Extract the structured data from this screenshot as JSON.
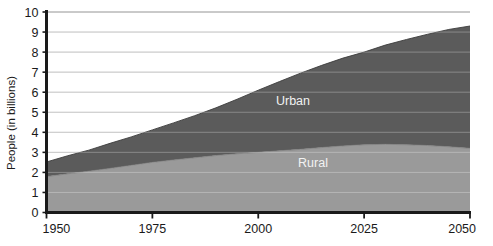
{
  "chart_data": {
    "type": "area",
    "title": "",
    "subtitle": "",
    "xlabel": "",
    "ylabel": "People (in billions)",
    "x": [
      1950,
      1955,
      1960,
      1965,
      1970,
      1975,
      1980,
      1985,
      1990,
      1995,
      2000,
      2005,
      2010,
      2015,
      2020,
      2025,
      2030,
      2035,
      2040,
      2045,
      2050
    ],
    "xlim": [
      1950,
      2050
    ],
    "ylim": [
      0,
      10
    ],
    "xticks": [
      1950,
      1975,
      2000,
      2025,
      2050
    ],
    "xtick_labels": [
      "1950",
      "1975",
      "2000",
      "2025",
      "2050"
    ],
    "yticks": [
      0,
      1,
      2,
      3,
      4,
      5,
      6,
      7,
      8,
      9,
      10
    ],
    "ytick_labels": [
      "0",
      "1",
      "2",
      "3",
      "4",
      "5",
      "6",
      "7",
      "8",
      "9",
      "10"
    ],
    "grid": "horizontal",
    "legend": "inline-labels",
    "stacked": true,
    "series": [
      {
        "name": "Rural",
        "label": "Rural",
        "color": "#9a9a9a",
        "values": [
          1.79,
          1.93,
          2.06,
          2.2,
          2.35,
          2.5,
          2.62,
          2.73,
          2.84,
          2.93,
          3.0,
          3.08,
          3.15,
          3.24,
          3.32,
          3.38,
          3.4,
          3.38,
          3.34,
          3.28,
          3.2
        ]
      },
      {
        "name": "Urban",
        "label": "Urban",
        "color": "#5b5b5b",
        "values": [
          0.73,
          0.9,
          1.05,
          1.25,
          1.42,
          1.62,
          1.85,
          2.1,
          2.38,
          2.72,
          3.1,
          3.45,
          3.8,
          4.1,
          4.38,
          4.62,
          4.95,
          5.25,
          5.55,
          5.85,
          6.1
        ]
      }
    ],
    "totals": [
      2.52,
      2.83,
      3.11,
      3.45,
      3.77,
      4.12,
      4.47,
      4.83,
      5.22,
      5.65,
      6.1,
      6.53,
      6.95,
      7.34,
      7.7,
      8.0,
      8.35,
      8.63,
      8.89,
      9.13,
      9.3
    ]
  },
  "axis": {
    "y_title": "People (in billions)"
  },
  "labels": {
    "urban": "Urban",
    "rural": "Rural"
  },
  "colors": {
    "urban": "#5b5b5b",
    "rural": "#9a9a9a",
    "axis": "#1a1a1a",
    "grid": "#b4b4b4",
    "background": "#ffffff"
  }
}
